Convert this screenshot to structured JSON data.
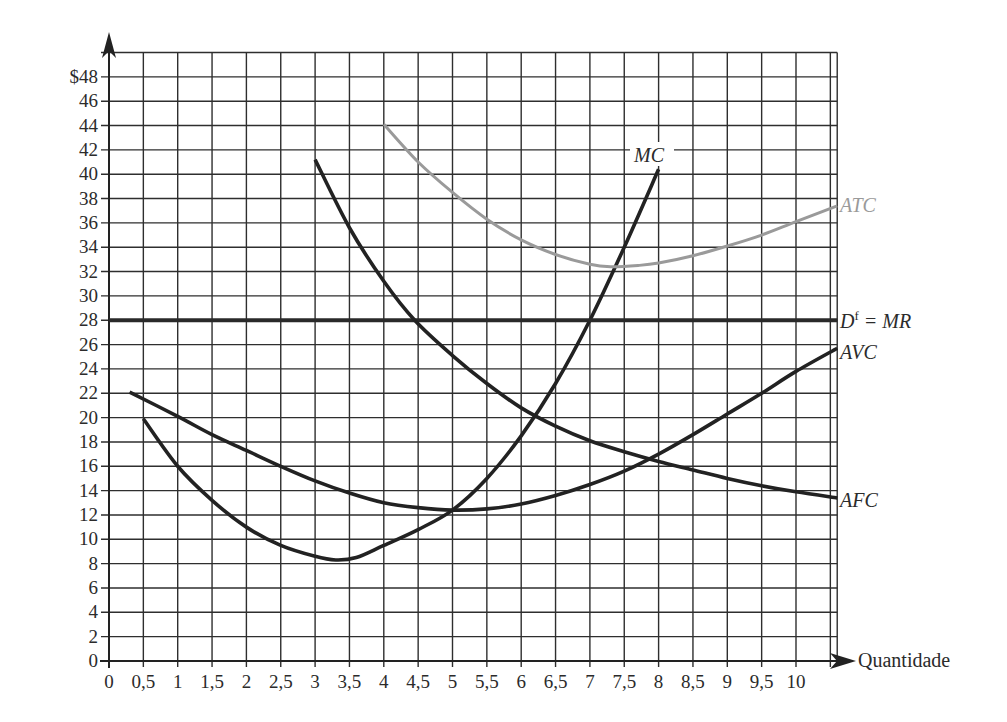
{
  "chart_data": {
    "type": "line",
    "title": "",
    "xlabel": "Quantidade",
    "ylabel": "$",
    "xlim": [
      0,
      10.6
    ],
    "ylim": [
      0,
      50
    ],
    "grid": true,
    "x_ticks": [
      "0",
      "0,5",
      "1",
      "1,5",
      "2",
      "2,5",
      "3",
      "3,5",
      "4",
      "4,5",
      "5",
      "5,5",
      "6",
      "6,5",
      "7",
      "7,5",
      "8",
      "8,5",
      "9",
      "9,5",
      "10"
    ],
    "y_ticks": [
      "0",
      "2",
      "4",
      "6",
      "8",
      "10",
      "12",
      "14",
      "16",
      "18",
      "20",
      "22",
      "24",
      "26",
      "28",
      "30",
      "32",
      "34",
      "36",
      "38",
      "40",
      "42",
      "44",
      "46",
      "$48"
    ],
    "series": [
      {
        "name": "MC",
        "label": "MC",
        "color": "#222222",
        "points": [
          [
            0.5,
            19.9
          ],
          [
            1,
            16
          ],
          [
            1.5,
            13.2
          ],
          [
            2,
            11
          ],
          [
            2.5,
            9.5
          ],
          [
            3,
            8.6
          ],
          [
            3.3,
            8.3
          ],
          [
            3.6,
            8.5
          ],
          [
            4,
            9.5
          ],
          [
            4.5,
            10.8
          ],
          [
            5,
            12.4
          ],
          [
            5.5,
            15
          ],
          [
            6,
            18.5
          ],
          [
            6.5,
            22.8
          ],
          [
            7,
            28
          ],
          [
            7.5,
            34
          ],
          [
            8,
            40.4
          ]
        ]
      },
      {
        "name": "ATC",
        "label": "ATC",
        "color": "#9a9a9a",
        "points": [
          [
            4,
            44.1
          ],
          [
            4.5,
            41
          ],
          [
            5,
            38.5
          ],
          [
            5.5,
            36.3
          ],
          [
            6,
            34.6
          ],
          [
            6.5,
            33.4
          ],
          [
            7,
            32.6
          ],
          [
            7.3,
            32.4
          ],
          [
            7.7,
            32.5
          ],
          [
            8,
            32.7
          ],
          [
            8.5,
            33.3
          ],
          [
            9,
            34.1
          ],
          [
            9.5,
            35
          ],
          [
            10,
            36.1
          ],
          [
            10.6,
            37.4
          ]
        ]
      },
      {
        "name": "Df = MR",
        "label_main": "D",
        "label_sup": "f",
        "label_rest": " = MR",
        "color": "#2a2a2a",
        "points": [
          [
            0,
            28
          ],
          [
            10.6,
            28
          ]
        ]
      },
      {
        "name": "AVC",
        "label": "AVC",
        "color": "#222222",
        "points": [
          [
            0.3,
            22.1
          ],
          [
            1,
            20.1
          ],
          [
            1.5,
            18.6
          ],
          [
            2,
            17.3
          ],
          [
            2.5,
            16
          ],
          [
            3,
            14.8
          ],
          [
            3.5,
            13.8
          ],
          [
            4,
            13
          ],
          [
            4.5,
            12.6
          ],
          [
            5,
            12.4
          ],
          [
            5.5,
            12.5
          ],
          [
            6,
            12.9
          ],
          [
            6.5,
            13.6
          ],
          [
            7,
            14.5
          ],
          [
            7.5,
            15.6
          ],
          [
            8,
            17
          ],
          [
            8.5,
            18.6
          ],
          [
            9,
            20.3
          ],
          [
            9.5,
            22
          ],
          [
            10,
            23.8
          ],
          [
            10.6,
            25.7
          ]
        ]
      },
      {
        "name": "AFC",
        "label": "AFC",
        "color": "#222222",
        "points": [
          [
            3,
            41.2
          ],
          [
            3.5,
            35.6
          ],
          [
            4,
            31.2
          ],
          [
            4.45,
            28
          ],
          [
            5,
            25.1
          ],
          [
            5.5,
            22.8
          ],
          [
            6,
            20.8
          ],
          [
            6.5,
            19.3
          ],
          [
            7,
            18.1
          ],
          [
            7.5,
            17.2
          ],
          [
            8,
            16.4
          ],
          [
            8.5,
            15.7
          ],
          [
            9,
            15
          ],
          [
            9.5,
            14.4
          ],
          [
            10,
            13.9
          ],
          [
            10.6,
            13.4
          ]
        ]
      }
    ]
  },
  "labels": {
    "mc": "MC",
    "atc": "ATC",
    "mr_d": "D",
    "mr_sup": "f",
    "mr_rest": " = MR",
    "avc": "AVC",
    "afc": "AFC",
    "x_axis_title": "Quantidade"
  },
  "colors": {
    "grid": "#2e2e2e",
    "curve_dark": "#222222",
    "curve_gray": "#9a9a9a",
    "text": "#2b2b2b"
  }
}
